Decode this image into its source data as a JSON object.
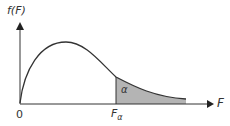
{
  "diagram": {
    "y_axis_label": "f(F)",
    "x_axis_label": "F",
    "origin_label": "0",
    "critical_label": "F",
    "critical_subscript": "α",
    "area_label": "α",
    "colors": {
      "line": "#333333",
      "shade": "#b4b4b4"
    }
  }
}
